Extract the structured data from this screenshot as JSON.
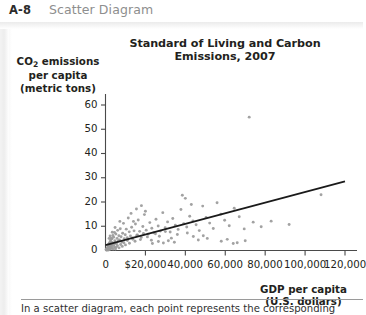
{
  "header": {
    "number": "A-8",
    "title": "Scatter Diagram"
  },
  "figure": {
    "caption": "In a scatter diagram, each point represents the corresponding values of"
  },
  "chart_data": {
    "type": "scatter",
    "title": "Standard of Living and Carbon Emissions, 2007",
    "xlabel_line1": "GDP per capita",
    "xlabel_line2": "(U.S. dollars)",
    "ylabel_line1_a": "CO",
    "ylabel_line1_sub": "2",
    "ylabel_line1_b": " emissions",
    "ylabel_line2": "per capita",
    "ylabel_line3": "(metric tons)",
    "xlim": [
      0,
      126000
    ],
    "ylim": [
      0,
      66
    ],
    "xticks": [
      0,
      20000,
      40000,
      60000,
      80000,
      100000,
      120000
    ],
    "xtick_labels": [
      "0",
      "$20,000",
      "40,000",
      "60,000",
      "80,000",
      "100,000",
      "120,000"
    ],
    "yticks": [
      0,
      10,
      20,
      30,
      40,
      50,
      60
    ],
    "ytick_labels": [
      "0",
      "10",
      "20",
      "30",
      "40",
      "50",
      "60"
    ],
    "grid": false,
    "legend": null,
    "point_color": "#9a9a9a",
    "line_color": "#1a1a1a",
    "trendline": {
      "label": "linear fit",
      "x": [
        0,
        120000
      ],
      "y": [
        2.2,
        28.5
      ]
    },
    "points": [
      [
        300,
        0.3
      ],
      [
        450,
        0.2
      ],
      [
        600,
        0.5
      ],
      [
        700,
        0.4
      ],
      [
        800,
        0.9
      ],
      [
        900,
        0.3
      ],
      [
        1000,
        1.1
      ],
      [
        1100,
        0.6
      ],
      [
        1200,
        1.4
      ],
      [
        1300,
        0.8
      ],
      [
        1400,
        2.1
      ],
      [
        1500,
        1.0
      ],
      [
        1600,
        2.6
      ],
      [
        1700,
        0.7
      ],
      [
        1800,
        1.6
      ],
      [
        1900,
        3.0
      ],
      [
        2000,
        1.2
      ],
      [
        2100,
        2.4
      ],
      [
        2200,
        0.9
      ],
      [
        2300,
        3.6
      ],
      [
        2400,
        1.8
      ],
      [
        2500,
        2.9
      ],
      [
        2600,
        4.3
      ],
      [
        2700,
        1.5
      ],
      [
        2800,
        2.2
      ],
      [
        2900,
        5.1
      ],
      [
        3000,
        3.4
      ],
      [
        3100,
        1.9
      ],
      [
        3300,
        4.8
      ],
      [
        3500,
        2.7
      ],
      [
        3700,
        6.2
      ],
      [
        3900,
        3.1
      ],
      [
        4100,
        5.5
      ],
      [
        4300,
        2.4
      ],
      [
        4500,
        7.4
      ],
      [
        4700,
        4.0
      ],
      [
        4900,
        3.3
      ],
      [
        5200,
        6.8
      ],
      [
        5500,
        2.8
      ],
      [
        5800,
        5.0
      ],
      [
        6100,
        8.3
      ],
      [
        6400,
        3.9
      ],
      [
        6700,
        6.1
      ],
      [
        7000,
        4.4
      ],
      [
        7400,
        9.0
      ],
      [
        7800,
        5.7
      ],
      [
        8200,
        3.5
      ],
      [
        8600,
        7.1
      ],
      [
        9000,
        11.2
      ],
      [
        9400,
        4.9
      ],
      [
        9900,
        6.5
      ],
      [
        10400,
        8.8
      ],
      [
        10900,
        5.3
      ],
      [
        11400,
        13.4
      ],
      [
        11900,
        7.7
      ],
      [
        12500,
        6.0
      ],
      [
        13100,
        9.6
      ],
      [
        13700,
        4.6
      ],
      [
        14300,
        8.1
      ],
      [
        15000,
        10.9
      ],
      [
        15700,
        6.3
      ],
      [
        16400,
        12.6
      ],
      [
        17100,
        7.9
      ],
      [
        17900,
        5.4
      ],
      [
        18700,
        9.9
      ],
      [
        19500,
        14.8
      ],
      [
        20400,
        8.4
      ],
      [
        21300,
        6.7
      ],
      [
        22200,
        11.5
      ],
      [
        23200,
        9.2
      ],
      [
        24200,
        7.3
      ],
      [
        25300,
        12.9
      ],
      [
        26400,
        10.1
      ],
      [
        27500,
        8.0
      ],
      [
        28700,
        15.6
      ],
      [
        29900,
        9.4
      ],
      [
        31100,
        11.8
      ],
      [
        32400,
        7.6
      ],
      [
        33700,
        13.2
      ],
      [
        35000,
        10.4
      ],
      [
        36400,
        8.7
      ],
      [
        37800,
        16.9
      ],
      [
        39200,
        11.1
      ],
      [
        40700,
        9.7
      ],
      [
        42200,
        14.1
      ],
      [
        43800,
        12.2
      ],
      [
        45400,
        10.6
      ],
      [
        47000,
        8.2
      ],
      [
        48700,
        18.3
      ],
      [
        50400,
        13.6
      ],
      [
        52200,
        11.3
      ],
      [
        54000,
        9.1
      ],
      [
        55900,
        19.7
      ],
      [
        57800,
        15.0
      ],
      [
        59700,
        12.5
      ],
      [
        62000,
        10.2
      ],
      [
        64500,
        17.4
      ],
      [
        67000,
        13.9
      ],
      [
        69500,
        8.9
      ],
      [
        72000,
        55.0
      ],
      [
        74000,
        11.7
      ],
      [
        78000,
        9.8
      ],
      [
        83000,
        12.1
      ],
      [
        92000,
        10.7
      ],
      [
        108000,
        23.0
      ],
      [
        5000,
        0.6
      ],
      [
        5300,
        1.3
      ],
      [
        6000,
        2.0
      ],
      [
        6800,
        1.1
      ],
      [
        7600,
        2.5
      ],
      [
        8400,
        1.7
      ],
      [
        9200,
        3.2
      ],
      [
        10000,
        2.3
      ],
      [
        11000,
        4.1
      ],
      [
        12000,
        3.0
      ],
      [
        13500,
        5.2
      ],
      [
        14800,
        3.8
      ],
      [
        16000,
        6.4
      ],
      [
        17500,
        4.5
      ],
      [
        19000,
        7.0
      ],
      [
        21000,
        5.6
      ],
      [
        23000,
        4.2
      ],
      [
        25000,
        6.9
      ],
      [
        27000,
        5.9
      ],
      [
        30000,
        7.8
      ],
      [
        2000,
        0.4
      ],
      [
        2600,
        0.7
      ],
      [
        3200,
        1.0
      ],
      [
        3800,
        0.6
      ],
      [
        4400,
        1.5
      ],
      [
        1500,
        0.2
      ],
      [
        1100,
        0.4
      ],
      [
        850,
        0.2
      ],
      [
        650,
        0.6
      ],
      [
        400,
        0.3
      ],
      [
        33000,
        5.1
      ],
      [
        36000,
        6.6
      ],
      [
        41000,
        7.2
      ],
      [
        44000,
        5.8
      ],
      [
        49000,
        6.1
      ],
      [
        23500,
        2.9
      ],
      [
        26500,
        3.7
      ],
      [
        29000,
        3.1
      ],
      [
        31500,
        4.0
      ],
      [
        34500,
        3.4
      ],
      [
        38500,
        22.8
      ],
      [
        40000,
        21.5
      ],
      [
        43000,
        19.0
      ],
      [
        46500,
        4.3
      ],
      [
        51000,
        5.0
      ],
      [
        18000,
        18.5
      ],
      [
        20000,
        16.2
      ],
      [
        15500,
        17.1
      ],
      [
        12800,
        15.3
      ],
      [
        14000,
        12.0
      ],
      [
        58000,
        3.8
      ],
      [
        61000,
        4.6
      ],
      [
        66000,
        3.2
      ],
      [
        70000,
        4.0
      ],
      [
        64000,
        2.9
      ],
      [
        2300,
        6.0
      ],
      [
        3400,
        7.5
      ],
      [
        1800,
        5.0
      ],
      [
        4800,
        9.5
      ],
      [
        7200,
        12.0
      ]
    ]
  }
}
